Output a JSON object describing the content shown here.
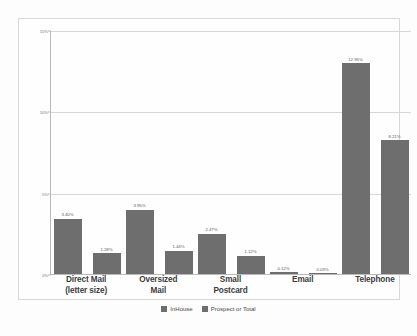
{
  "chart_data": {
    "type": "bar",
    "title": "",
    "subtitle": "",
    "xlabel": "",
    "ylabel": "",
    "ylim": [
      0,
      15
    ],
    "grid": true,
    "legend_position": "bottom",
    "ytick_labels": [
      "15%",
      "10%",
      "5%",
      "0%"
    ],
    "ytick_values": [
      15,
      10,
      5,
      0
    ],
    "categories": [
      "Direct Mail (letter size)",
      "Oversized Mail",
      "Small Postcard",
      "Email",
      "Telephone"
    ],
    "category_lines": [
      [
        "Direct Mail",
        "(letter size)"
      ],
      [
        "Oversized",
        "Mail"
      ],
      [
        "Small",
        "Postcard"
      ],
      [
        "Email"
      ],
      [
        "Telephone"
      ]
    ],
    "series": [
      {
        "name": "InHouse",
        "color": "#6e6e6e",
        "values": [
          3.4,
          3.95,
          2.47,
          0.12,
          12.95
        ],
        "labels": [
          "3.40%",
          "3.95%",
          "2.47%",
          "0.12%",
          "12.95%"
        ]
      },
      {
        "name": "Prospect or Total",
        "color": "#6e6e6e",
        "values": [
          1.28,
          1.44,
          1.12,
          0.03,
          8.21
        ],
        "labels": [
          "1.28%",
          "1.44%",
          "1.12%",
          "0.03%",
          "8.21%"
        ]
      }
    ]
  },
  "legend": {
    "items": [
      {
        "label": "InHouse",
        "color": "#6e6e6e"
      },
      {
        "label": "Prospect or Total",
        "color": "#6e6e6e"
      }
    ]
  },
  "colors": {
    "bar": "#6e6e6e",
    "gridline": "#d6d6d6",
    "axis": "#b9b9b9",
    "frame": "#d8d8d8",
    "background": "#fdfdfd",
    "label_text": "#5e5e5e",
    "category_text": "#3c3c3c"
  }
}
